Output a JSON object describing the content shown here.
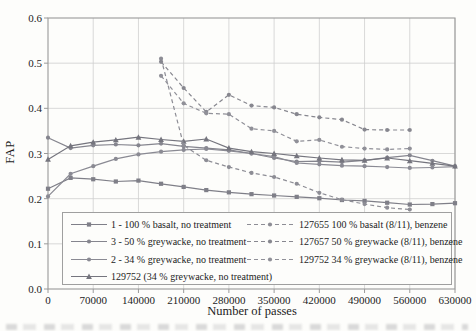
{
  "chart_data": {
    "type": "line",
    "title": "",
    "xlabel": "Number of passes",
    "ylabel": "FAP",
    "xlim": [
      0,
      630000
    ],
    "ylim": [
      0.0,
      0.6
    ],
    "grid": true,
    "legend_position": "inside-bottom, two columns",
    "xticks": [
      0,
      70000,
      140000,
      210000,
      280000,
      350000,
      420000,
      490000,
      560000,
      630000
    ],
    "xtick_labels": [
      "0",
      "70000",
      "140000",
      "210000",
      "280000",
      "350000",
      "420000",
      "490000",
      "560000",
      "630000"
    ],
    "yticks": [
      0.0,
      0.1,
      0.2,
      0.3,
      0.4,
      0.5,
      0.6
    ],
    "ytick_labels": [
      "0.0",
      "0.1",
      "0.2",
      "0.3",
      "0.4",
      "0.5",
      "0.6"
    ],
    "series": [
      {
        "name": "1 - 100 % basalt, no treatment",
        "style": "solid",
        "marker": "square",
        "color": "#7f7f88",
        "legend_col": 0,
        "legend_row": 0,
        "x": [
          0,
          35000,
          70000,
          105000,
          140000,
          175000,
          210000,
          245000,
          280000,
          315000,
          350000,
          385000,
          420000,
          455000,
          490000,
          525000,
          560000,
          595000,
          630000
        ],
        "y": [
          0.222,
          0.246,
          0.243,
          0.238,
          0.24,
          0.233,
          0.226,
          0.219,
          0.214,
          0.21,
          0.207,
          0.204,
          0.201,
          0.197,
          0.195,
          0.191,
          0.187,
          0.188,
          0.19
        ]
      },
      {
        "name": "3 - 50 % greywacke, no treatment",
        "style": "solid",
        "marker": "circle",
        "color": "#85858e",
        "legend_col": 0,
        "legend_row": 1,
        "x": [
          0,
          35000,
          70000,
          105000,
          140000,
          175000,
          210000,
          245000,
          280000,
          315000,
          350000,
          385000,
          420000,
          455000,
          490000,
          525000,
          560000,
          595000,
          630000
        ],
        "y": [
          0.335,
          0.312,
          0.318,
          0.32,
          0.318,
          0.322,
          0.316,
          0.312,
          0.308,
          0.3,
          0.29,
          0.282,
          0.283,
          0.281,
          0.285,
          0.291,
          0.296,
          0.284,
          0.272
        ]
      },
      {
        "name": "2 - 34 % greywacke, no treatment",
        "style": "solid",
        "marker": "circle",
        "color": "#8a8a93",
        "legend_col": 0,
        "legend_row": 2,
        "x": [
          0,
          35000,
          70000,
          105000,
          140000,
          175000,
          210000,
          245000,
          280000,
          315000,
          350000,
          385000,
          420000,
          455000,
          490000,
          525000,
          560000,
          595000,
          630000
        ],
        "y": [
          0.205,
          0.255,
          0.272,
          0.288,
          0.298,
          0.304,
          0.308,
          0.31,
          0.306,
          0.3,
          0.293,
          0.279,
          0.276,
          0.273,
          0.272,
          0.27,
          0.268,
          0.269,
          0.271
        ]
      },
      {
        "name": "129752 (34 % greywacke, no treatment)",
        "style": "solid",
        "marker": "triangle",
        "color": "#75757e",
        "legend_col": 0,
        "legend_row": 3,
        "x": [
          0,
          35000,
          70000,
          105000,
          140000,
          175000,
          210000,
          245000,
          280000,
          315000,
          350000,
          385000,
          420000,
          455000,
          490000,
          525000,
          560000,
          595000,
          630000
        ],
        "y": [
          0.287,
          0.317,
          0.325,
          0.33,
          0.336,
          0.331,
          0.327,
          0.332,
          0.312,
          0.304,
          0.3,
          0.295,
          0.29,
          0.286,
          0.285,
          0.29,
          0.284,
          0.278,
          0.272
        ]
      },
      {
        "name": "127655 100 % basalt (8/11), benzene",
        "style": "dashed",
        "marker": "circle",
        "color": "#8d8d95",
        "legend_col": 1,
        "legend_row": 0,
        "x": [
          175000,
          210000,
          245000,
          280000,
          315000,
          350000,
          385000,
          420000,
          455000,
          490000,
          525000,
          560000
        ],
        "y": [
          0.51,
          0.318,
          0.285,
          0.27,
          0.257,
          0.248,
          0.233,
          0.213,
          0.198,
          0.188,
          0.18,
          0.176
        ]
      },
      {
        "name": "127657 50 % greywacke (8/11), benzene",
        "style": "dashed",
        "marker": "circle",
        "color": "#87878f",
        "legend_col": 1,
        "legend_row": 1,
        "x": [
          175000,
          210000,
          245000,
          280000,
          315000,
          350000,
          385000,
          420000,
          455000,
          490000,
          525000,
          560000
        ],
        "y": [
          0.503,
          0.445,
          0.392,
          0.43,
          0.406,
          0.402,
          0.387,
          0.38,
          0.375,
          0.353,
          0.352,
          0.352
        ]
      },
      {
        "name": "129752 34 % greywacke (8/11), benzene",
        "style": "dashed",
        "marker": "circle",
        "color": "#909098",
        "legend_col": 1,
        "legend_row": 2,
        "x": [
          175000,
          210000,
          245000,
          280000,
          315000,
          350000,
          385000,
          420000,
          455000,
          490000,
          525000,
          560000
        ],
        "y": [
          0.472,
          0.411,
          0.389,
          0.387,
          0.355,
          0.35,
          0.327,
          0.33,
          0.315,
          0.311,
          0.309,
          0.311
        ]
      }
    ]
  },
  "style": {
    "grid_color": "#cfcfcf",
    "frame_color": "#9a9a9a",
    "text_color": "#1c1c1c",
    "background": "#fdfdfb"
  }
}
